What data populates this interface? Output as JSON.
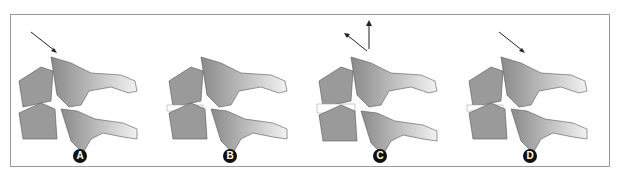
{
  "figure": {
    "panels": [
      {
        "label": "A",
        "arrows": [
          "down-right"
        ],
        "disc_state": "compressed-anterior"
      },
      {
        "label": "B",
        "arrows": [],
        "disc_state": "neutral"
      },
      {
        "label": "C",
        "arrows": [
          "up-left",
          "up"
        ],
        "disc_state": "distracted"
      },
      {
        "label": "D",
        "arrows": [
          "down-right"
        ],
        "disc_state": "compressed-anterior"
      }
    ]
  },
  "colors": {
    "border": "#9a9a9a",
    "bone_dark": "#8c8c8c",
    "bone_light": "#e8e8e8",
    "badge": "#111111"
  }
}
